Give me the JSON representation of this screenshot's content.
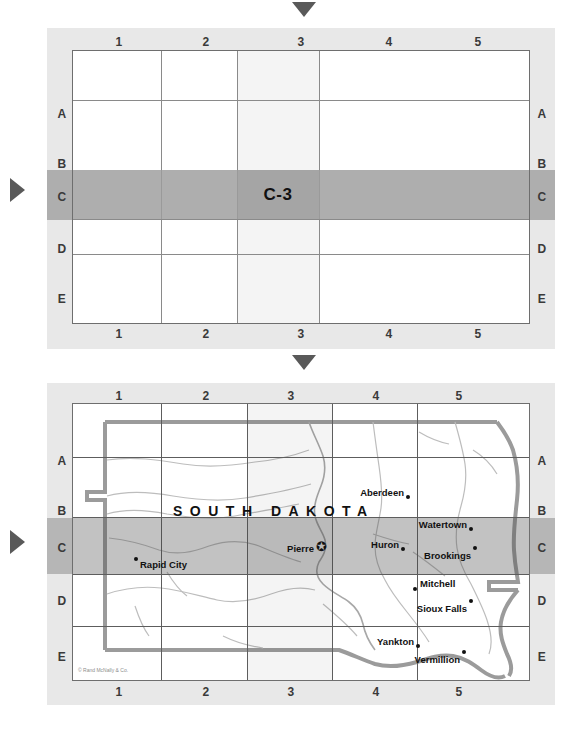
{
  "page": {
    "accent_marker_color": "#595959",
    "panel_background": "#e8e8e8",
    "highlight_row_color": "#aeaeae",
    "highlight_cell_color": "#a5a5a5",
    "grid_line_color": "#8a8a8a"
  },
  "grid_panel": {
    "columns": [
      "1",
      "2",
      "3",
      "4",
      "5"
    ],
    "rows": [
      "A",
      "B",
      "C",
      "D",
      "E"
    ],
    "highlighted_column": "3",
    "highlighted_row": "C",
    "highlighted_cell_label": "C-3",
    "top_marker": "down-triangle",
    "left_marker": "right-triangle"
  },
  "map_panel": {
    "columns": [
      "1",
      "2",
      "3",
      "4",
      "5"
    ],
    "rows": [
      "A",
      "B",
      "C",
      "D",
      "E"
    ],
    "highlighted_column": "3",
    "highlighted_row": "C",
    "state_label": "SOUTH DAKOTA",
    "copyright": "© Rand McNally & Co.",
    "capital_symbol": "✪",
    "top_marker": "down-triangle",
    "left_marker": "right-triangle",
    "cities": [
      {
        "name": "Aberdeen",
        "grid": "A-4",
        "capital": false
      },
      {
        "name": "Watertown",
        "grid": "B-5",
        "capital": false
      },
      {
        "name": "Pierre",
        "grid": "C-3",
        "capital": true
      },
      {
        "name": "Huron",
        "grid": "C-4",
        "capital": false
      },
      {
        "name": "Brookings",
        "grid": "C-5",
        "capital": false
      },
      {
        "name": "Rapid City",
        "grid": "C-1",
        "capital": false
      },
      {
        "name": "Mitchell",
        "grid": "D-4",
        "capital": false
      },
      {
        "name": "Sioux Falls",
        "grid": "D-5",
        "capital": false
      },
      {
        "name": "Yankton",
        "grid": "E-4",
        "capital": false
      },
      {
        "name": "Vermillion",
        "grid": "E-5",
        "capital": false
      }
    ]
  }
}
